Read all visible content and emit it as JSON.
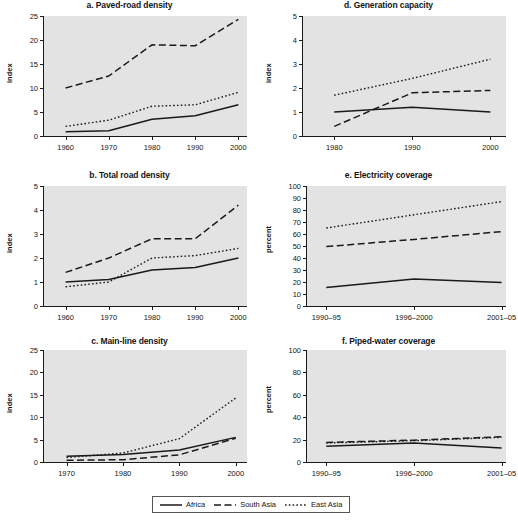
{
  "legend": {
    "items": [
      {
        "label": "Africa",
        "style": "solid",
        "color": "#1a1a1a"
      },
      {
        "label": "South Asia",
        "style": "dashed",
        "color": "#1a1a1a"
      },
      {
        "label": "East Asia",
        "style": "dotted",
        "color": "#1a1a1a"
      }
    ]
  },
  "colors": {
    "plot_background": "#e3e3e3",
    "page_background": "#ffffff",
    "ink": "#1a1a1a"
  },
  "chart_data": [
    {
      "id": "a",
      "type": "line",
      "title": "a. Paved-road density",
      "xlabel": "",
      "ylabel": "index",
      "x": [
        1960,
        1970,
        1980,
        1990,
        2000
      ],
      "xtick_labels": [
        "1960",
        "1970",
        "1980",
        "1990",
        "2000"
      ],
      "xlim": [
        1955,
        2002
      ],
      "ylim": [
        0,
        25
      ],
      "yticks": [
        0,
        5,
        10,
        15,
        20,
        25
      ],
      "ytick_labels": [
        "0",
        "5",
        "10",
        "15",
        "20",
        "25"
      ],
      "grid": false,
      "legend_position": "figure-bottom",
      "series": [
        {
          "name": "Africa",
          "style": "solid",
          "values": [
            0.9,
            1.1,
            3.5,
            4.2,
            6.5
          ]
        },
        {
          "name": "South Asia",
          "style": "dashed",
          "values": [
            10.0,
            12.5,
            19.0,
            18.8,
            24.3
          ]
        },
        {
          "name": "East Asia",
          "style": "dotted",
          "values": [
            2.0,
            3.3,
            6.2,
            6.5,
            9.1
          ]
        }
      ]
    },
    {
      "id": "b",
      "type": "line",
      "title": "b. Total road density",
      "xlabel": "",
      "ylabel": "index",
      "x": [
        1960,
        1970,
        1980,
        1990,
        2000
      ],
      "xtick_labels": [
        "1960",
        "1970",
        "1980",
        "1990",
        "2000"
      ],
      "xlim": [
        1955,
        2002
      ],
      "ylim": [
        0,
        5
      ],
      "yticks": [
        0,
        1,
        2,
        3,
        4,
        5
      ],
      "ytick_labels": [
        "0",
        "1",
        "2",
        "3",
        "4",
        "5"
      ],
      "grid": false,
      "legend_position": "figure-bottom",
      "series": [
        {
          "name": "Africa",
          "style": "solid",
          "values": [
            1.0,
            1.1,
            1.5,
            1.6,
            2.0
          ]
        },
        {
          "name": "South Asia",
          "style": "dashed",
          "values": [
            1.4,
            2.0,
            2.8,
            2.8,
            4.2
          ]
        },
        {
          "name": "East Asia",
          "style": "dotted",
          "values": [
            0.8,
            1.0,
            2.0,
            2.1,
            2.4
          ]
        }
      ]
    },
    {
      "id": "c",
      "type": "line",
      "title": "c. Main-line density",
      "xlabel": "",
      "ylabel": "index",
      "x": [
        1970,
        1980,
        1990,
        2000
      ],
      "xtick_labels": [
        "1970",
        "1980",
        "1990",
        "2000"
      ],
      "xlim": [
        1966,
        2002
      ],
      "ylim": [
        0,
        25
      ],
      "yticks": [
        0,
        5,
        10,
        15,
        20,
        25
      ],
      "ytick_labels": [
        "0",
        "5",
        "10",
        "15",
        "20",
        "25"
      ],
      "grid": false,
      "legend_position": "figure-bottom",
      "series": [
        {
          "name": "Africa",
          "style": "solid",
          "values": [
            1.3,
            1.7,
            2.7,
            5.5
          ]
        },
        {
          "name": "South Asia",
          "style": "dashed",
          "values": [
            0.4,
            0.5,
            1.6,
            5.3
          ]
        },
        {
          "name": "East Asia",
          "style": "dotted",
          "values": [
            1.0,
            2.0,
            5.2,
            14.3
          ]
        }
      ]
    },
    {
      "id": "d",
      "type": "line",
      "title": "d. Generation capacity",
      "xlabel": "",
      "ylabel": "index",
      "x": [
        1980,
        1990,
        2000
      ],
      "xtick_labels": [
        "1980",
        "1990",
        "2000"
      ],
      "xlim": [
        1976,
        2002
      ],
      "ylim": [
        0,
        5
      ],
      "yticks": [
        0,
        1,
        2,
        3,
        4,
        5
      ],
      "ytick_labels": [
        "0",
        "1",
        "2",
        "3",
        "4",
        "5"
      ],
      "grid": false,
      "legend_position": "figure-bottom",
      "series": [
        {
          "name": "Africa",
          "style": "solid",
          "values": [
            1.0,
            1.2,
            1.0
          ]
        },
        {
          "name": "South Asia",
          "style": "dashed",
          "values": [
            0.4,
            1.8,
            1.9
          ]
        },
        {
          "name": "East Asia",
          "style": "dotted",
          "values": [
            1.7,
            2.4,
            3.2
          ]
        }
      ]
    },
    {
      "id": "e",
      "type": "line",
      "title": "e. Electricity coverage",
      "xlabel": "",
      "ylabel": "percent",
      "x": [
        0,
        1,
        2
      ],
      "xtick_labels": [
        "1990–95",
        "1996–2000",
        "2001–05"
      ],
      "xlim": [
        -0.22,
        2.05
      ],
      "ylim": [
        0,
        100
      ],
      "yticks": [
        0,
        10,
        20,
        30,
        40,
        50,
        60,
        70,
        80,
        90,
        100
      ],
      "ytick_labels": [
        "0",
        "10",
        "20",
        "30",
        "40",
        "50",
        "60",
        "70",
        "80",
        "90",
        "100"
      ],
      "grid": false,
      "legend_position": "figure-bottom",
      "series": [
        {
          "name": "Africa",
          "style": "solid",
          "values": [
            15.5,
            22.5,
            19.5
          ]
        },
        {
          "name": "South Asia",
          "style": "dashed",
          "values": [
            49.5,
            55.5,
            62.0
          ]
        },
        {
          "name": "East Asia",
          "style": "dotted",
          "values": [
            65.0,
            76.0,
            87.0
          ]
        }
      ]
    },
    {
      "id": "f",
      "type": "line",
      "title": "f. Piped-water coverage",
      "xlabel": "",
      "ylabel": "percent",
      "x": [
        0,
        1,
        2
      ],
      "xtick_labels": [
        "1990–95",
        "1996–2000",
        "2001–05"
      ],
      "xlim": [
        -0.22,
        2.05
      ],
      "ylim": [
        0,
        100
      ],
      "yticks": [
        0,
        20,
        40,
        60,
        80,
        100
      ],
      "ytick_labels": [
        "0",
        "20",
        "40",
        "60",
        "80",
        "100"
      ],
      "grid": false,
      "legend_position": "figure-bottom",
      "series": [
        {
          "name": "Africa",
          "style": "solid",
          "values": [
            14.0,
            17.0,
            12.5
          ]
        },
        {
          "name": "South Asia",
          "style": "dashed",
          "values": [
            17.5,
            19.5,
            22.5
          ]
        },
        {
          "name": "East Asia",
          "style": "dotted",
          "values": [
            17.0,
            19.0,
            22.0
          ]
        }
      ]
    }
  ]
}
